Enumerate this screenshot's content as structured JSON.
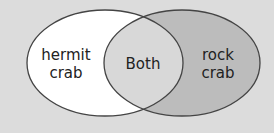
{
  "diagram": {
    "type": "venn",
    "left": {
      "label_line1": "hermit",
      "label_line2": "crab",
      "fill": "#ffffff"
    },
    "overlap": {
      "label": "Both",
      "fill": "#d8d8d8"
    },
    "right": {
      "label_line1": "rock",
      "label_line2": "crab",
      "fill": "#bcbcbc"
    },
    "background": "#dcdcdc",
    "stroke": "#444444"
  }
}
